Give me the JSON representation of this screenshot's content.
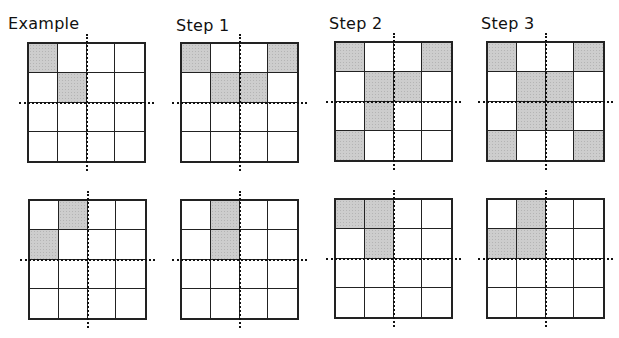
{
  "labels": [
    "Example",
    "Step 1",
    "Step 2",
    "Step 3"
  ],
  "colors": {
    "shaded": "#cdcdcd",
    "line": "#222222",
    "background": "#ffffff"
  },
  "panels": [
    {
      "id": "example-top",
      "row": 0,
      "col": 0,
      "x": 27,
      "y": 42,
      "shaded": [
        [
          0,
          0
        ],
        [
          1,
          1
        ]
      ]
    },
    {
      "id": "step1-top",
      "row": 0,
      "col": 1,
      "x": 180,
      "y": 42,
      "shaded": [
        [
          0,
          0
        ],
        [
          0,
          3
        ],
        [
          1,
          1
        ],
        [
          1,
          2
        ]
      ]
    },
    {
      "id": "step2-top",
      "row": 0,
      "col": 2,
      "x": 334,
      "y": 41,
      "shaded": [
        [
          0,
          0
        ],
        [
          0,
          3
        ],
        [
          1,
          1
        ],
        [
          1,
          2
        ],
        [
          2,
          1
        ],
        [
          3,
          0
        ]
      ]
    },
    {
      "id": "step3-top",
      "row": 0,
      "col": 3,
      "x": 486,
      "y": 41,
      "shaded": [
        [
          0,
          0
        ],
        [
          0,
          3
        ],
        [
          1,
          1
        ],
        [
          1,
          2
        ],
        [
          2,
          1
        ],
        [
          2,
          2
        ],
        [
          3,
          0
        ],
        [
          3,
          3
        ]
      ]
    },
    {
      "id": "example-bottom",
      "row": 1,
      "col": 0,
      "x": 28,
      "y": 199,
      "shaded": [
        [
          0,
          1
        ],
        [
          1,
          0
        ]
      ]
    },
    {
      "id": "step1-bottom",
      "row": 1,
      "col": 1,
      "x": 180,
      "y": 199,
      "shaded": [
        [
          0,
          1
        ],
        [
          1,
          1
        ]
      ]
    },
    {
      "id": "step2-bottom",
      "row": 1,
      "col": 2,
      "x": 334,
      "y": 198,
      "shaded": [
        [
          0,
          0
        ],
        [
          0,
          1
        ],
        [
          1,
          1
        ]
      ]
    },
    {
      "id": "step3-bottom",
      "row": 1,
      "col": 3,
      "x": 486,
      "y": 198,
      "shaded": [
        [
          0,
          1
        ],
        [
          1,
          0
        ],
        [
          1,
          1
        ]
      ]
    }
  ],
  "grid_size": 4
}
